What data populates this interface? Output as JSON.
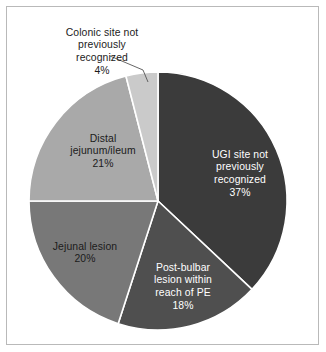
{
  "figure": {
    "background": "#ffffff",
    "frame_color": "#b9b9b9"
  },
  "chart_data": {
    "type": "pie",
    "title": "",
    "subtitle": "",
    "xlabel": "",
    "ylabel": "",
    "legend_position": "none",
    "grid": false,
    "start_angle_deg": 0,
    "direction": "clockwise",
    "total_percent": 100,
    "categories": [
      "UGI site not previously recognized",
      "Post-bulbar lesion within reach of PE",
      "Jejunal lesion",
      "Distal jejunum/ileum",
      "Colonic site not previously recognized"
    ],
    "values": [
      37,
      18,
      20,
      21,
      4
    ],
    "value_unit": "%",
    "colors": [
      "#3b3b3b",
      "#4f4f4f",
      "#787878",
      "#a9a9a9",
      "#cacaca"
    ],
    "slices": [
      {
        "label": "UGI site not previously recognized",
        "label_lines": "UGI site not\npreviously\nrecognized",
        "value": 37,
        "value_text": "37%",
        "color": "#3b3b3b",
        "text_color": "#ffffff",
        "label_placement": "inside",
        "leader_line": false
      },
      {
        "label": "Post-bulbar lesion within reach of PE",
        "label_lines": "Post-bulbar\nlesion within\nreach of PE",
        "value": 18,
        "value_text": "18%",
        "color": "#4f4f4f",
        "text_color": "#ffffff",
        "label_placement": "inside",
        "leader_line": false
      },
      {
        "label": "Jejunal lesion",
        "label_lines": "Jejunal lesion",
        "value": 20,
        "value_text": "20%",
        "color": "#787878",
        "text_color": "#1b1b1b",
        "label_placement": "inside",
        "leader_line": false
      },
      {
        "label": "Distal jejunum/ileum",
        "label_lines": "Distal\njejunum/ileum",
        "value": 21,
        "value_text": "21%",
        "color": "#a9a9a9",
        "text_color": "#1b1b1b",
        "label_placement": "inside",
        "leader_line": false
      },
      {
        "label": "Colonic site not previously recognized",
        "label_lines": "Colonic site not\npreviously\nrecognized",
        "value": 4,
        "value_text": "4%",
        "color": "#cacaca",
        "text_color": "#1b1b1b",
        "label_placement": "outside",
        "leader_line": true
      }
    ]
  }
}
